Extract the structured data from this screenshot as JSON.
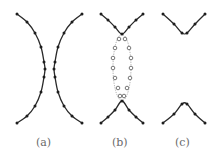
{
  "figure": {
    "panels": [
      {
        "id": "a",
        "label": "(a)",
        "description": "Two separate curved chains facing each other, nearly touching at middle",
        "chains": [
          {
            "points": [
              [
                17,
                14
              ],
              [
                27,
                22
              ],
              [
                35,
                33
              ],
              [
                41,
                47
              ],
              [
                44,
                62
              ],
              [
                45,
                69
              ],
              [
                44,
                77
              ],
              [
                41,
                92
              ],
              [
                35,
                106
              ],
              [
                27,
                116
              ],
              [
                17,
                123
              ]
            ]
          },
          {
            "points": [
              [
                82,
                14
              ],
              [
                72,
                22
              ],
              [
                64,
                33
              ],
              [
                58,
                47
              ],
              [
                55,
                62
              ],
              [
                54,
                69
              ],
              [
                55,
                77
              ],
              [
                58,
                92
              ],
              [
                64,
                106
              ],
              [
                72,
                116
              ],
              [
                82,
                123
              ]
            ]
          }
        ]
      },
      {
        "id": "b",
        "label": "(b)",
        "description": "Upper and lower V chains connected by dashed elliptical loop of open circles",
        "chains": [
          {
            "points": [
              [
                101,
                14
              ],
              [
                108,
                20
              ],
              [
                115,
                27
              ],
              [
                122,
                34
              ],
              [
                129,
                27
              ],
              [
                136,
                20
              ],
              [
                143,
                14
              ]
            ]
          },
          {
            "points": [
              [
                101,
                123
              ],
              [
                108,
                117
              ],
              [
                115,
                110
              ],
              [
                122,
                101
              ],
              [
                129,
                110
              ],
              [
                136,
                117
              ],
              [
                143,
                123
              ]
            ]
          }
        ],
        "loop_open_points": [
          [
            119,
            39
          ],
          [
            115,
            48
          ],
          [
            113,
            58
          ],
          [
            113,
            68
          ],
          [
            115,
            78
          ],
          [
            118,
            88
          ],
          [
            120,
            96
          ],
          [
            125,
            39
          ],
          [
            129,
            48
          ],
          [
            131,
            58
          ],
          [
            131,
            68
          ],
          [
            130,
            78
          ],
          [
            127,
            88
          ],
          [
            124,
            96
          ]
        ]
      },
      {
        "id": "c",
        "label": "(c)",
        "description": "Upper V and lower inverted V chains, separated",
        "chains": [
          {
            "points": [
              [
                163,
                14
              ],
              [
                174,
                24
              ],
              [
                182,
                33
              ],
              [
                187,
                33
              ],
              [
                195,
                24
              ],
              [
                205,
                14
              ]
            ]
          },
          {
            "points": [
              [
                163,
                123
              ],
              [
                174,
                114
              ],
              [
                182,
                104
              ],
              [
                187,
                104
              ],
              [
                195,
                114
              ],
              [
                205,
                123
              ]
            ]
          }
        ]
      }
    ]
  },
  "colors": {
    "stroke": "#2a2a2a",
    "label": "#6a6a6a",
    "background": "#ffffff"
  }
}
